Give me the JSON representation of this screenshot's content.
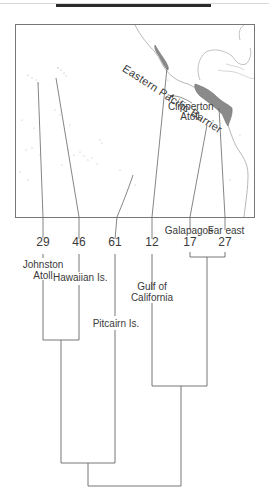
{
  "map": {
    "barrier_label": "Eastern Pacific Barrier",
    "clipperton_label_line1": "Clipperton",
    "clipperton_label_line2": "Atoll"
  },
  "dendrogram": {
    "leaves": [
      {
        "count": "29",
        "name_line1": "Johnston",
        "name_line2": "Atoll"
      },
      {
        "count": "46",
        "name_line1": "Hawaiian Is.",
        "name_line2": ""
      },
      {
        "count": "61",
        "name_line1": "Pitcairn Is.",
        "name_line2": ""
      },
      {
        "count": "12",
        "name_line1": "Gulf of",
        "name_line2": "California"
      },
      {
        "count": "17",
        "name_line1": "Galapagos",
        "name_line2": ""
      },
      {
        "count": "27",
        "name_line1": "Far east",
        "name_line2": ""
      }
    ],
    "clusters": [
      {
        "members": [
          "Johnston Atoll",
          "Hawaiian Is."
        ]
      },
      {
        "members": [
          "Johnston Atoll",
          "Hawaiian Is.",
          "Pitcairn Is."
        ]
      },
      {
        "members": [
          "Galapagos",
          "Far east"
        ]
      },
      {
        "members": [
          "Gulf of California",
          "Galapagos",
          "Far east"
        ]
      },
      {
        "members": [
          "all"
        ]
      }
    ]
  },
  "colors": {
    "line": "#555555",
    "land_fill": "#8a8a8a",
    "frame": "#777777"
  }
}
